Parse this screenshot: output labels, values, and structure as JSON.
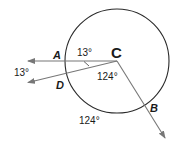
{
  "diagram": {
    "type": "circle-central-angles",
    "circle": {
      "center_label": "C",
      "cx": 117,
      "cy": 61,
      "r": 52
    },
    "points": {
      "A": {
        "label": "A",
        "x": 57,
        "y": 58
      },
      "D": {
        "label": "D",
        "x": 59,
        "y": 88
      },
      "B": {
        "label": "B",
        "x": 150,
        "y": 110
      },
      "C": {
        "label": "C",
        "x": 113,
        "y": 56
      }
    },
    "rays": [
      {
        "name": "CA",
        "from": [
          117,
          61
        ],
        "to": [
          26,
          61
        ]
      },
      {
        "name": "CD",
        "from": [
          117,
          61
        ],
        "to": [
          26,
          83
        ]
      },
      {
        "name": "CB",
        "from": [
          117,
          61
        ],
        "to": [
          167,
          141
        ]
      }
    ],
    "angle_labels": {
      "acd_inner": "13°",
      "acd_outer": "13°",
      "dcb_inner": "124°",
      "db_arc_outer": "124°"
    },
    "colors": {
      "circle": "#2a2a2a",
      "ray": "#777777",
      "arrow": "#777777",
      "text": "#1a1a1a"
    }
  }
}
